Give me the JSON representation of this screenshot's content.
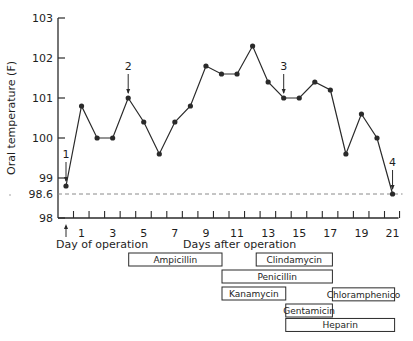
{
  "chart_data": {
    "type": "line",
    "title": "",
    "xlabel": "Days after operation",
    "xlabel_secondary": "Day of operation",
    "ylabel": "Oral temperature (F)",
    "ylim": [
      98,
      103
    ],
    "xlim": [
      0,
      21
    ],
    "grid": false,
    "legend": null,
    "y_ticks": [
      98,
      99,
      100,
      101,
      102,
      103
    ],
    "y_reference": {
      "value": 98.6,
      "label": "98.6",
      "style": "dashed"
    },
    "x_ticks": [
      0,
      1,
      2,
      3,
      4,
      5,
      6,
      7,
      8,
      9,
      10,
      11,
      12,
      13,
      14,
      15,
      16,
      17,
      18,
      19,
      20,
      21
    ],
    "x_tick_labels": [
      {
        "day": 1,
        "label": "1"
      },
      {
        "day": 3,
        "label": "3"
      },
      {
        "day": 5,
        "label": "5"
      },
      {
        "day": 7,
        "label": "7"
      },
      {
        "day": 9,
        "label": "9"
      },
      {
        "day": 11,
        "label": "11"
      },
      {
        "day": 13,
        "label": "13"
      },
      {
        "day": 15,
        "label": "15"
      },
      {
        "day": 17,
        "label": "17"
      },
      {
        "day": 19,
        "label": "19"
      },
      {
        "day": 21,
        "label": "21"
      }
    ],
    "x": [
      0,
      1,
      2,
      3,
      4,
      5,
      6,
      7,
      8,
      9,
      10,
      11,
      12,
      13,
      14,
      15,
      16,
      17,
      18,
      19,
      20,
      21
    ],
    "series": [
      {
        "name": "Oral temperature",
        "values": [
          98.8,
          100.8,
          100.0,
          100.0,
          101.0,
          100.4,
          99.6,
          100.4,
          100.8,
          101.8,
          101.6,
          101.6,
          102.3,
          101.4,
          101.0,
          101.0,
          101.4,
          101.2,
          99.6,
          100.6,
          100.0,
          98.6
        ]
      }
    ],
    "annotations": [
      {
        "label": "1",
        "day": 0,
        "type": "arrow-down"
      },
      {
        "label": "2",
        "day": 4,
        "type": "arrow-down"
      },
      {
        "label": "3",
        "day": 14,
        "type": "arrow-down"
      },
      {
        "label": "4",
        "day": 21,
        "type": "arrow-down"
      }
    ],
    "operation_marker": {
      "day": 0,
      "type": "arrow-up"
    },
    "drug_bars": [
      {
        "name": "Ampicillin",
        "start": 4,
        "end": 10,
        "row": 0
      },
      {
        "name": "Clindamycin",
        "start": 12.2,
        "end": 17.1,
        "row": 0
      },
      {
        "name": "Penicillin",
        "start": 10,
        "end": 17.1,
        "row": 1
      },
      {
        "name": "Kanamycin",
        "start": 10,
        "end": 14.1,
        "row": 2
      },
      {
        "name": "Chloramphenico",
        "start": 17.1,
        "end": 21.1,
        "row": 2.05
      },
      {
        "name": "Gentamicin",
        "start": 14.1,
        "end": 17.1,
        "row": 3
      },
      {
        "name": "Heparin",
        "start": 14.1,
        "end": 21.1,
        "row": 3.85
      }
    ]
  },
  "colors": {
    "line": "#2a2a2a",
    "axis": "#2a2a2a",
    "reference_line": "#8a8a8a",
    "bar_border": "#2a2a2a",
    "background": "#ffffff"
  }
}
